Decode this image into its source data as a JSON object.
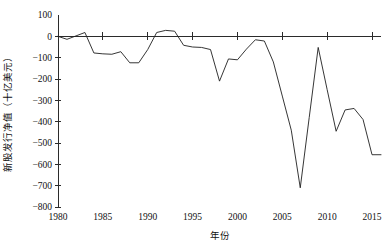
{
  "chart_data": {
    "type": "line",
    "title": "",
    "xlabel": "年份",
    "ylabel": "新股发行净值（十亿美元）",
    "xlim": [
      1980,
      2016
    ],
    "ylim": [
      -800,
      100
    ],
    "ytick_step": 100,
    "grid": false,
    "legend": "none",
    "xticks": [
      "1980",
      "1985",
      "1990",
      "1995",
      "2000",
      "2005",
      "2010",
      "2015"
    ],
    "xtick_values": [
      1980,
      1985,
      1990,
      1995,
      2000,
      2005,
      2010,
      2015
    ],
    "yticks": [
      "100",
      "0",
      "-100",
      "-200",
      "-300",
      "-400",
      "-500",
      "-600",
      "-700",
      "-800"
    ],
    "ytick_values": [
      100,
      0,
      -100,
      -200,
      -300,
      -400,
      -500,
      -600,
      -700,
      -800
    ],
    "series": [
      {
        "name": "新股发行净值",
        "x": [
          1980,
          1981,
          1982,
          1983,
          1984,
          1985,
          1986,
          1987,
          1988,
          1989,
          1990,
          1991,
          1992,
          1993,
          1994,
          1995,
          1996,
          1997,
          1998,
          1999,
          2000,
          2001,
          2002,
          2003,
          2004,
          2005,
          2006,
          2007,
          2008,
          2009,
          2010,
          2011,
          2012,
          2013,
          2014,
          2015,
          2016
        ],
        "values": [
          0,
          -14,
          2,
          18,
          -78,
          -82,
          -84,
          -72,
          -124,
          -124,
          -62,
          18,
          28,
          24,
          -42,
          -50,
          -52,
          -62,
          -210,
          -106,
          -110,
          -60,
          -16,
          -22,
          -120,
          -280,
          -440,
          -710,
          -380,
          -52,
          -250,
          -445,
          -345,
          -338,
          -390,
          -555,
          -555
        ]
      }
    ],
    "annotations": []
  }
}
